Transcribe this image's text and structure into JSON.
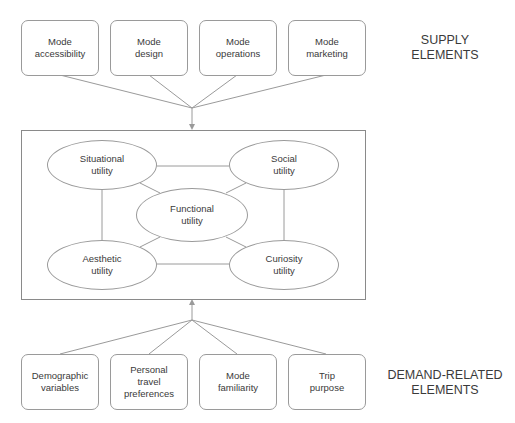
{
  "supply": {
    "label": "SUPPLY\nELEMENTS",
    "boxes": [
      {
        "label": "Mode\naccessibility"
      },
      {
        "label": "Mode\ndesign"
      },
      {
        "label": "Mode\noperations"
      },
      {
        "label": "Mode\nmarketing"
      }
    ]
  },
  "utilities": {
    "situational": "Situational\nutility",
    "social": "Social\nutility",
    "functional": "Functional\nutility",
    "aesthetic": "Aesthetic\nutility",
    "curiosity": "Curiosity\nutility"
  },
  "demand": {
    "label": "DEMAND-RELATED\nELEMENTS",
    "boxes": [
      {
        "label": "Demographic\nvariables"
      },
      {
        "label": "Personal\ntravel\npreferences"
      },
      {
        "label": "Mode\nfamiliarity"
      },
      {
        "label": "Trip\npurpose"
      }
    ]
  },
  "colors": {
    "line": "#9a9a9a",
    "text": "#3a3a3a"
  }
}
